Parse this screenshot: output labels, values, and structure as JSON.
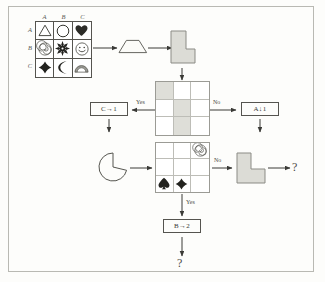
{
  "diagram": {
    "colors": {
      "ink": "#3a3a36",
      "rule_line": "#55544f",
      "grid_line": "#bdbdb7",
      "shaded_cell": "#dedeD8",
      "block_fill": "#dcdcd6",
      "page_bg": "#fdfdfb",
      "frame_border": "#b9b9b3"
    },
    "legend_matrix": {
      "name": "symbol-matrix",
      "column_headers": [
        "A",
        "B",
        "C"
      ],
      "row_headers": [
        "A",
        "B",
        "C"
      ],
      "cells": [
        {
          "row": "A",
          "col": "A",
          "symbol": "triangle-outline-icon"
        },
        {
          "row": "A",
          "col": "B",
          "symbol": "circle-outline-icon"
        },
        {
          "row": "A",
          "col": "C",
          "symbol": "heart-filled-icon"
        },
        {
          "row": "B",
          "col": "A",
          "symbol": "spiral-icon"
        },
        {
          "row": "B",
          "col": "B",
          "symbol": "sun-burst-icon"
        },
        {
          "row": "B",
          "col": "C",
          "symbol": "smiley-face-icon"
        },
        {
          "row": "C",
          "col": "A",
          "symbol": "diamond-filled-icon"
        },
        {
          "row": "C",
          "col": "B",
          "symbol": "crescent-moon-icon"
        },
        {
          "row": "C",
          "col": "C",
          "symbol": "rainbow-arch-icon"
        }
      ]
    },
    "shapes": {
      "trapezoid_label": "trapezoid-shape",
      "l_block_top_label": "l-block-shape",
      "l_block_right_label": "l-block-shape",
      "pacman_label": "pacman-shape"
    },
    "grid_top": {
      "name": "state-grid-top",
      "rows": 3,
      "cols": 3,
      "shaded_cells": [
        [
          0,
          0
        ],
        [
          1,
          1
        ],
        [
          2,
          1
        ]
      ]
    },
    "grid_bottom": {
      "name": "state-grid-bottom",
      "rows": 3,
      "cols": 3,
      "cells": [
        {
          "row": 0,
          "col": 2,
          "symbol": "spiral-icon"
        },
        {
          "row": 2,
          "col": 0,
          "symbol": "spade-filled-icon"
        },
        {
          "row": 2,
          "col": 1,
          "symbol": "diamond-filled-icon"
        }
      ]
    },
    "op_boxes": [
      {
        "id": "c-to-1",
        "text": "C→1"
      },
      {
        "id": "a-down-1",
        "text": "A↓1"
      },
      {
        "id": "b-to-2",
        "text": "B→2"
      }
    ],
    "arrow_labels": [
      {
        "id": "yes-left",
        "text": "Yes"
      },
      {
        "id": "no-right",
        "text": "No"
      },
      {
        "id": "no-mid",
        "text": "No"
      },
      {
        "id": "yes-bottom",
        "text": "Yes"
      }
    ],
    "unknowns": [
      {
        "id": "question-right",
        "text": "?"
      },
      {
        "id": "question-bottom",
        "text": "?"
      }
    ]
  }
}
